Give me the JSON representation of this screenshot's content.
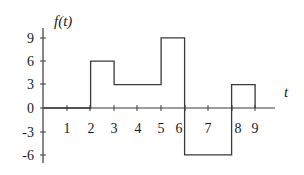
{
  "chart_data": {
    "type": "line",
    "subtype": "piecewise-constant step signal",
    "title": "",
    "xlabel": "t",
    "ylabel": "f(t)",
    "x_ticks": [
      1,
      2,
      3,
      4,
      5,
      6,
      7,
      8,
      9
    ],
    "y_ticks": [
      9,
      6,
      3,
      0,
      -3,
      -6
    ],
    "xlim": [
      0,
      9.8
    ],
    "ylim": [
      -6.5,
      10.5
    ],
    "grid": false,
    "legend": null,
    "segments": [
      {
        "t_start": 0,
        "t_end": 2,
        "value": 0
      },
      {
        "t_start": 2,
        "t_end": 3,
        "value": 6
      },
      {
        "t_start": 3,
        "t_end": 5,
        "value": 3
      },
      {
        "t_start": 5,
        "t_end": 6,
        "value": 9
      },
      {
        "t_start": 6,
        "t_end": 8,
        "value": -6
      },
      {
        "t_start": 8,
        "t_end": 9,
        "value": 3
      },
      {
        "t_start": 9,
        "t_end": 9.8,
        "value": 0
      }
    ],
    "x": [
      0,
      2,
      2,
      3,
      3,
      5,
      5,
      6,
      6,
      8,
      8,
      9,
      9
    ],
    "y": [
      0,
      0,
      6,
      6,
      3,
      3,
      9,
      9,
      -6,
      -6,
      3,
      3,
      0
    ]
  },
  "labels": {
    "y_axis": "f(t)",
    "x_axis": "t",
    "y_tick_labels": [
      "9",
      "6",
      "3",
      "0",
      "-3",
      "-6"
    ],
    "x_tick_labels": [
      "1",
      "2",
      "3",
      "4",
      "5",
      "6",
      "7",
      "8",
      "9"
    ]
  }
}
